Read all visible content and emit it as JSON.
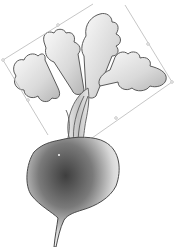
{
  "canvas": {
    "subject": "radish illustration",
    "background": "#ffffff",
    "outline_color": "#5a5a5a",
    "selection_color": "#b8b8b8",
    "selection": {
      "rotated": true,
      "corners": [
        [
          3,
          60
        ],
        [
          93,
          4
        ],
        [
          172,
          82
        ],
        [
          48,
          135
        ]
      ],
      "handles": [
        [
          58,
          25
        ],
        [
          150,
          48
        ],
        [
          115,
          115
        ],
        [
          25,
          100
        ]
      ]
    }
  }
}
